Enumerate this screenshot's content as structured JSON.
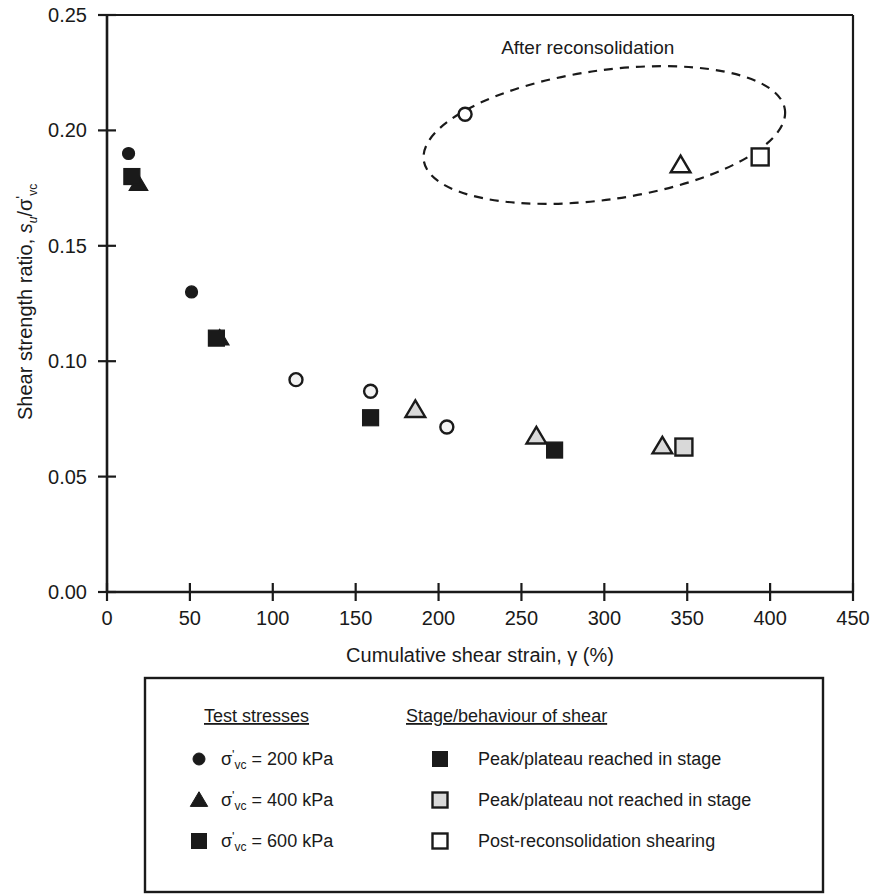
{
  "chart_data": {
    "type": "scatter",
    "title": "",
    "xlabel": "Cumulative shear strain, γ (%)",
    "ylabel": "Shear strength ratio, s_u/σ'_vc",
    "xlim": [
      0,
      450
    ],
    "ylim": [
      0.0,
      0.25
    ],
    "xticks": [
      0,
      50,
      100,
      150,
      200,
      250,
      300,
      350,
      400,
      450
    ],
    "yticks": [
      "0.00",
      "0.05",
      "0.10",
      "0.15",
      "0.20",
      "0.25"
    ],
    "ytick_values": [
      0.0,
      0.05,
      0.1,
      0.15,
      0.2,
      0.25
    ],
    "grid": false,
    "legend_position": "below-plot",
    "annotations": [
      {
        "text": "After reconsolidation",
        "x": 290,
        "y": 0.233,
        "shape": "dashed-ellipse",
        "ellipse_cx": 300,
        "ellipse_cy": 0.198,
        "ellipse_rx": 110,
        "ellipse_ry": 0.028,
        "ellipse_rotation_deg": -8
      }
    ],
    "series": [
      {
        "name": "σ'vc = 200 kPa, Peak/plateau reached in stage",
        "marker": "circle",
        "fill": "#1a1a1a",
        "points": [
          {
            "x": 13,
            "y": 0.19
          },
          {
            "x": 51,
            "y": 0.13
          }
        ]
      },
      {
        "name": "σ'vc = 400 kPa, Peak/plateau reached in stage",
        "marker": "triangle",
        "fill": "#1a1a1a",
        "points": [
          {
            "x": 19,
            "y": 0.177
          },
          {
            "x": 68,
            "y": 0.11
          }
        ]
      },
      {
        "name": "σ'vc = 600 kPa, Peak/plateau reached in stage",
        "marker": "square",
        "fill": "#1a1a1a",
        "points": [
          {
            "x": 15,
            "y": 0.18
          },
          {
            "x": 66,
            "y": 0.11
          },
          {
            "x": 159,
            "y": 0.0755
          },
          {
            "x": 270,
            "y": 0.0615
          }
        ]
      },
      {
        "name": "σ'vc = 200 kPa, Peak/plateau not reached in stage",
        "marker": "circle",
        "fill": "#f2f2f2",
        "points": [
          {
            "x": 114,
            "y": 0.092
          },
          {
            "x": 159,
            "y": 0.087
          },
          {
            "x": 205,
            "y": 0.0715
          }
        ]
      },
      {
        "name": "σ'vc = 400 kPa, Peak/plateau not reached in stage",
        "marker": "triangle",
        "fill": "#d9d9d9",
        "points": [
          {
            "x": 186,
            "y": 0.079
          },
          {
            "x": 259,
            "y": 0.0675
          },
          {
            "x": 335,
            "y": 0.0632
          }
        ]
      },
      {
        "name": "σ'vc = 600 kPa, Peak/plateau not reached in stage",
        "marker": "square",
        "fill": "#d9d9d9",
        "points": [
          {
            "x": 348,
            "y": 0.0628
          }
        ]
      },
      {
        "name": "σ'vc = 200 kPa, Post-reconsolidation shearing",
        "marker": "circle",
        "fill": "#ffffff",
        "points": [
          {
            "x": 216,
            "y": 0.207
          }
        ]
      },
      {
        "name": "σ'vc = 400 kPa, Post-reconsolidation shearing",
        "marker": "triangle",
        "fill": "#ffffff",
        "points": [
          {
            "x": 346,
            "y": 0.185
          }
        ]
      },
      {
        "name": "σ'vc = 600 kPa, Post-reconsolidation shearing",
        "marker": "square",
        "fill": "#ffffff",
        "points": [
          {
            "x": 394,
            "y": 0.1885
          }
        ]
      }
    ]
  },
  "axes": {
    "y_title_parts": {
      "main": "Shear strength ratio, ",
      "s": "s",
      "s_sub": "u",
      "slash": "/",
      "sigma": "σ",
      "prime": "'",
      "sigma_sub": "vc"
    },
    "x_title": "Cumulative shear strain, γ (%)",
    "xticklabels": [
      "0",
      "50",
      "100",
      "150",
      "200",
      "250",
      "300",
      "350",
      "400",
      "450"
    ],
    "yticklabels": [
      "0.00",
      "0.05",
      "0.10",
      "0.15",
      "0.20",
      "0.25"
    ]
  },
  "annotation": {
    "after_reconsolidation": "After reconsolidation"
  },
  "legend": {
    "col1_heading": "Test stresses",
    "col2_heading": "Stage/behaviour of shear",
    "stress_items": [
      {
        "marker": "circle",
        "sigma": "σ",
        "prime": "'",
        "sub": "vc",
        "text": " = 200 kPa"
      },
      {
        "marker": "triangle",
        "sigma": "σ",
        "prime": "'",
        "sub": "vc",
        "text": " = 400 kPa"
      },
      {
        "marker": "square",
        "sigma": "σ",
        "prime": "'",
        "sub": "vc",
        "text": " = 600 kPa"
      }
    ],
    "behaviour_items": [
      {
        "marker": "square",
        "fill": "#1a1a1a",
        "label": "Peak/plateau reached in stage"
      },
      {
        "marker": "square",
        "fill": "#d9d9d9",
        "label": "Peak/plateau not reached in stage"
      },
      {
        "marker": "square",
        "fill": "#ffffff",
        "label": "Post-reconsolidation shearing"
      }
    ]
  },
  "colors": {
    "axis": "#1a1a1a",
    "filled": "#1a1a1a",
    "gray_fill": "#d9d9d9",
    "open_fill": "#ffffff",
    "text": "#1a1a1a"
  }
}
